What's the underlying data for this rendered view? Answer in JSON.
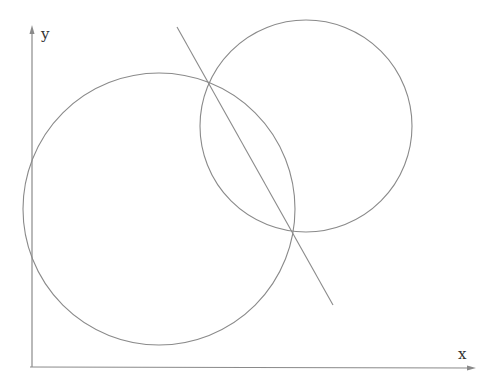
{
  "diagram": {
    "axes": {
      "x_label": "x",
      "y_label": "y"
    },
    "circles": [
      {
        "name": "large-circle",
        "cx": 159,
        "cy": 209,
        "r": 136
      },
      {
        "name": "small-circle",
        "cx": 306,
        "cy": 126,
        "r": 106
      }
    ],
    "line": {
      "x1": 177,
      "y1": 27,
      "x2": 333,
      "y2": 305
    },
    "intersections": [
      {
        "x": 208,
        "y": 83
      },
      {
        "x": 292,
        "y": 231
      }
    ],
    "colors": {
      "stroke": "#8a8a8a",
      "axis": "#8a8a8a",
      "background": "#ffffff"
    }
  }
}
